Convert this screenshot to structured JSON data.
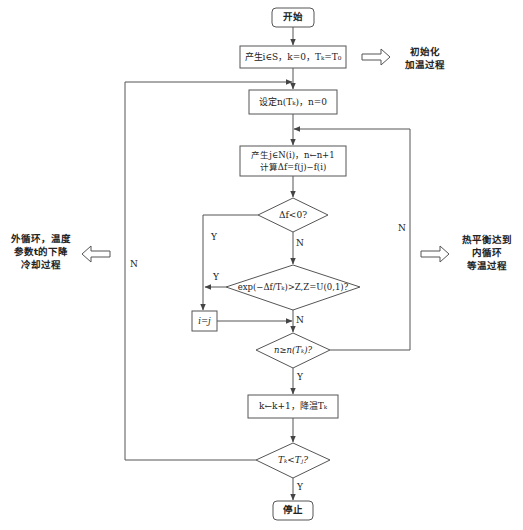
{
  "flowchart": {
    "start": "开始",
    "init": "产生i∈S，k=0，Tₖ=T₀",
    "set_n": "设定n(Tₖ)，n=0",
    "generate_line1": "产生j∈N(i)，n←n+1",
    "generate_line2": "计算Δf=f(j)−f(i)",
    "decision_delta": "Δf<0?",
    "decision_exp": "exp(−Δf/Tₖ)>Z,Z=U(0,1)?",
    "assign": "i=j",
    "decision_n": "n≥n(Tₖ)?",
    "cool": "k←k+1，降温Tₖ",
    "decision_t": "Tₖ<Tⱼ?",
    "stop": "停止"
  },
  "edge_labels": {
    "delta_yes": "Y",
    "delta_no": "N",
    "exp_yes": "Y",
    "exp_no": "N",
    "n_yes": "Y",
    "n_no": "N",
    "t_yes": "Y",
    "t_no": "N"
  },
  "annotations": {
    "init_line1": "初始化",
    "init_line2": "加温过程",
    "inner_line1": "热平衡达到",
    "inner_line2": "内循环",
    "inner_line3": "等温过程",
    "outer_line1": "外循环，温度",
    "outer_line2": "参数t的下降",
    "outer_line3": "冷却过程"
  },
  "colors": {
    "stroke": "#555555",
    "text": "#222222",
    "background": "#ffffff"
  }
}
